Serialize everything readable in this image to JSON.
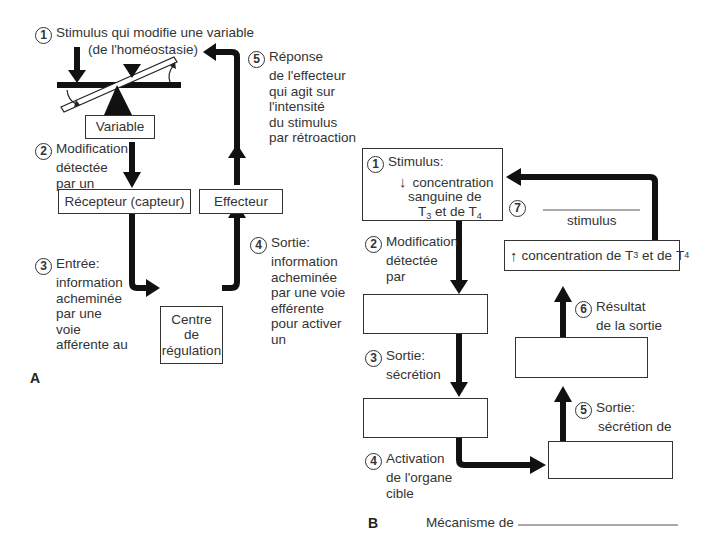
{
  "diagram_a": {
    "panel_label": "A",
    "step1": {
      "number": "1",
      "line1": "Stimulus qui modifie une variable",
      "line2": "(de l'homéostasie)"
    },
    "variable_box": "Variable",
    "step2": {
      "number": "2",
      "lines": [
        "Modification",
        "détectée",
        "par un"
      ]
    },
    "receptor_box": "Récepteur (capteur)",
    "effector_box": "Effecteur",
    "step3": {
      "number": "3",
      "lines": [
        "Entrée:",
        "information",
        "acheminée",
        "par une",
        "voie",
        "afférente au"
      ]
    },
    "control_center_box": [
      "Centre",
      "de",
      "régulation"
    ],
    "step4": {
      "number": "4",
      "lines": [
        "Sortie:",
        "information",
        "acheminée",
        "par une voie",
        "efférente",
        "pour activer",
        "un"
      ]
    },
    "step5": {
      "number": "5",
      "lines": [
        "Réponse",
        "de l'effecteur",
        "qui agit sur",
        "l'intensité",
        "du stimulus",
        "par rétroaction"
      ]
    }
  },
  "diagram_b": {
    "panel_label": "B",
    "step1": {
      "number": "1",
      "title": "Stimulus:",
      "arrow": "↓",
      "lines": [
        "concentration",
        "sanguine de"
      ],
      "hormones": {
        "a": "T",
        "a_sub": "3",
        "mid": " et de ",
        "b": "T",
        "b_sub": "4"
      }
    },
    "step2": {
      "number": "2",
      "lines": [
        "Modification",
        "détectée",
        "par"
      ]
    },
    "step3": {
      "number": "3",
      "lines": [
        "Sortie:",
        "sécrétion"
      ]
    },
    "step4": {
      "number": "4",
      "lines": [
        "Activation",
        "de l'organe",
        "cible"
      ]
    },
    "step5": {
      "number": "5",
      "lines": [
        "Sortie:",
        "sécrétion de"
      ]
    },
    "step6": {
      "number": "6",
      "lines": [
        "Résultat",
        "de la sortie"
      ]
    },
    "step7": {
      "number": "7",
      "blank_caption": "stimulus"
    },
    "result_box": {
      "arrow": "↑",
      "text": "concentration de ",
      "a": "T",
      "a_sub": "3",
      "mid": " et de ",
      "b": "T",
      "b_sub": "4"
    },
    "mechanism": {
      "label": "Mécanisme de"
    }
  }
}
